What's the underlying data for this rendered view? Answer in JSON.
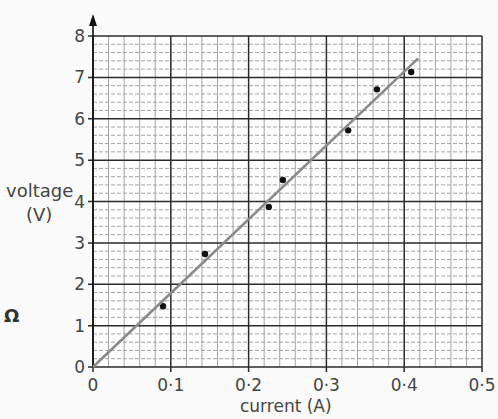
{
  "chart_data": {
    "type": "scatter",
    "title": "",
    "xlabel": "current (A)",
    "ylabel": "voltage (V)",
    "xlim": [
      0,
      0.5
    ],
    "ylim": [
      0,
      8
    ],
    "x_ticks": [
      "0",
      "0·1",
      "0·2",
      "0·3",
      "0·4",
      "0·5"
    ],
    "y_ticks": [
      "0",
      "1",
      "2",
      "3",
      "4",
      "5",
      "6",
      "7",
      "8"
    ],
    "grid": {
      "major": true,
      "minor": true,
      "minor_per_major_x": 5,
      "minor_per_major_y": 5
    },
    "series": [
      {
        "name": "measurements",
        "kind": "points",
        "x": [
          0.09,
          0.144,
          0.226,
          0.244,
          0.328,
          0.365,
          0.409
        ],
        "y": [
          1.47,
          2.73,
          3.87,
          4.52,
          5.72,
          6.71,
          7.13
        ]
      },
      {
        "name": "line of best fit",
        "kind": "line",
        "x": [
          0,
          0.418
        ],
        "y": [
          0,
          7.46
        ]
      }
    ],
    "side_symbol": "Ω"
  },
  "labels": {
    "ylabel_main": "voltage",
    "ylabel_unit": "(V)",
    "xlabel": "current (A)",
    "side_symbol": "Ω"
  },
  "colors": {
    "major_grid": "#2a2a2a",
    "minor_grid": "#9a9a9a",
    "fit_line": "#8a8a8a",
    "points": "#111111"
  }
}
